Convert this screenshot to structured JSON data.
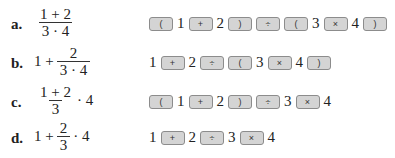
{
  "rows": [
    {
      "label": "a.",
      "expression": {
        "type": "frac",
        "num": "1 + 2",
        "den": "3 · 4"
      },
      "keys": [
        {
          "t": "key",
          "v": "("
        },
        {
          "t": "d",
          "v": "1"
        },
        {
          "t": "key",
          "v": "+"
        },
        {
          "t": "d",
          "v": "2"
        },
        {
          "t": "key",
          "v": ")"
        },
        {
          "t": "key",
          "v": "÷"
        },
        {
          "t": "key",
          "v": "("
        },
        {
          "t": "d",
          "v": "3"
        },
        {
          "t": "key",
          "v": "×"
        },
        {
          "t": "d",
          "v": "4"
        },
        {
          "t": "key",
          "v": ")"
        }
      ]
    },
    {
      "label": "b.",
      "expression": {
        "type": "pre-frac",
        "pre": "1 +",
        "num": "2",
        "den": "3 · 4"
      },
      "keys": [
        {
          "t": "d",
          "v": "1"
        },
        {
          "t": "key",
          "v": "+"
        },
        {
          "t": "d",
          "v": "2"
        },
        {
          "t": "key",
          "v": "÷"
        },
        {
          "t": "key",
          "v": "("
        },
        {
          "t": "d",
          "v": "3"
        },
        {
          "t": "key",
          "v": "×"
        },
        {
          "t": "d",
          "v": "4"
        },
        {
          "t": "key",
          "v": ")"
        }
      ]
    },
    {
      "label": "c.",
      "expression": {
        "type": "frac-post",
        "num": "1 + 2",
        "den": "3",
        "post": "· 4"
      },
      "keys": [
        {
          "t": "key",
          "v": "("
        },
        {
          "t": "d",
          "v": "1"
        },
        {
          "t": "key",
          "v": "+"
        },
        {
          "t": "d",
          "v": "2"
        },
        {
          "t": "key",
          "v": ")"
        },
        {
          "t": "key",
          "v": "÷"
        },
        {
          "t": "d",
          "v": "3"
        },
        {
          "t": "key",
          "v": "×"
        },
        {
          "t": "d",
          "v": "4"
        }
      ]
    },
    {
      "label": "d.",
      "expression": {
        "type": "pre-frac-post",
        "pre": "1 +",
        "num": "2",
        "den": "3",
        "post": "· 4"
      },
      "keys": [
        {
          "t": "d",
          "v": "1"
        },
        {
          "t": "key",
          "v": "+"
        },
        {
          "t": "d",
          "v": "2"
        },
        {
          "t": "key",
          "v": "÷"
        },
        {
          "t": "d",
          "v": "3"
        },
        {
          "t": "key",
          "v": "×"
        },
        {
          "t": "d",
          "v": "4"
        }
      ]
    }
  ],
  "colors": {
    "key_fill": "#d4d4d4",
    "key_border": "#8c8c8c",
    "text": "#222222"
  }
}
